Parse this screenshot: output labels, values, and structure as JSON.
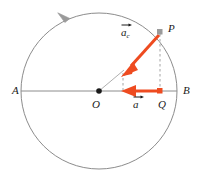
{
  "figure": {
    "type": "physics-diagram",
    "background_color": "#ffffff",
    "stroke_color": "#8c8c8c",
    "accent_color": "#ee4b20",
    "point_color": "#1a1a1a",
    "labels": {
      "A": "A",
      "B": "B",
      "O": "O",
      "P": "P",
      "Q": "Q",
      "a_c_base": "a",
      "a_c_subscript": "c",
      "a_base": "a"
    },
    "geometry": {
      "center": {
        "x": 99,
        "y": 91
      },
      "radius": 78,
      "point_A": {
        "x": 21,
        "y": 91
      },
      "point_B": {
        "x": 177,
        "y": 91
      },
      "point_P": {
        "x": 160,
        "y": 32
      },
      "point_Q": {
        "x": 160,
        "y": 91
      },
      "ac_tip": {
        "x": 123,
        "y": 75
      },
      "a_tip": {
        "x": 122,
        "y": 91
      },
      "rotation_direction": "counterclockwise"
    },
    "vectors": [
      {
        "name": "centripetal-acceleration",
        "label": "a_c",
        "from": "P",
        "to": "toward center O",
        "color": "#ee4b20"
      },
      {
        "name": "projection-acceleration",
        "label": "a",
        "from": "Q",
        "to": "toward center O",
        "color": "#ee4b20"
      }
    ],
    "guides": [
      {
        "name": "dashed-vertical-P-to-Q",
        "style": "dashed",
        "color": "#9a9a9a"
      },
      {
        "name": "dashed-short-vertical-at-ac-tip",
        "style": "dashed",
        "color": "#9a9a9a"
      },
      {
        "name": "radius-O-to-ac-tip",
        "style": "solid-thin",
        "color": "#9a9a9a"
      },
      {
        "name": "diameter-A-to-B",
        "style": "solid",
        "color": "#8c8c8c"
      }
    ]
  }
}
